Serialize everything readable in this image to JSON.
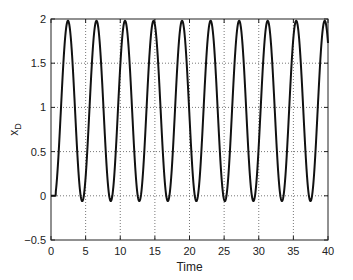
{
  "chart_data": {
    "type": "line",
    "title": "",
    "xlabel": "Time",
    "ylabel": "x",
    "ylabel_subscript": "D",
    "xlim": [
      0,
      40
    ],
    "ylim": [
      -0.5,
      2
    ],
    "xticks": [
      0,
      5,
      10,
      15,
      20,
      25,
      30,
      35,
      40
    ],
    "yticks": [
      -0.5,
      0,
      0.5,
      1,
      1.5,
      2
    ],
    "xtick_labels": [
      "0",
      "5",
      "10",
      "15",
      "20",
      "25",
      "30",
      "35",
      "40"
    ],
    "ytick_labels": [
      "−0.5",
      "0",
      "0.5",
      "1",
      "1.5",
      "2"
    ],
    "grid": true,
    "grid_style": "dotted",
    "legend": null,
    "series": [
      {
        "name": "x_D",
        "color": "#111111",
        "description": "Oscillation: flat at 0 until t≈0.7, then periodic between about -0.06 and 1.98 with period ≈4.12",
        "model": {
          "onset": 0.7,
          "offset": 0.96,
          "amplitude": 1.02,
          "period": 4.12,
          "phase": 0.39
        },
        "peaks": {
          "x": [
            2.45,
            6.5,
            10.7,
            14.7,
            19.0,
            23.2,
            27.3,
            31.3,
            35.5,
            39.5
          ],
          "y": [
            1.98,
            1.98,
            1.98,
            1.99,
            1.98,
            1.98,
            1.98,
            1.98,
            1.98,
            1.98
          ]
        },
        "troughs": {
          "x": [
            4.5,
            8.7,
            12.8,
            16.9,
            21.0,
            25.1,
            29.2,
            33.3,
            37.4
          ],
          "y": [
            -0.06,
            -0.06,
            -0.06,
            -0.06,
            -0.06,
            -0.06,
            -0.06,
            -0.06,
            -0.06
          ]
        },
        "x": [
          0,
          0.7,
          2.45,
          4.5,
          6.5,
          8.7,
          10.7,
          12.8,
          14.7,
          16.9,
          19.0,
          21.0,
          23.2,
          25.1,
          27.3,
          29.2,
          31.3,
          33.3,
          35.5,
          37.4,
          39.5,
          40
        ],
        "y": [
          0,
          0,
          1.98,
          -0.06,
          1.98,
          -0.06,
          1.98,
          -0.06,
          1.99,
          -0.06,
          1.98,
          -0.06,
          1.98,
          -0.06,
          1.98,
          -0.06,
          1.98,
          -0.06,
          1.98,
          -0.06,
          1.98,
          1.75
        ]
      }
    ]
  }
}
